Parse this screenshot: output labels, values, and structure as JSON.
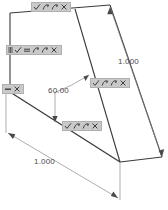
{
  "app": {
    "view_name": "parametric-sketch-viewport",
    "background_color": "#ffffff"
  },
  "sketch": {
    "line_color": "#3a3a3a",
    "dimension_color": "#4a4a4a",
    "geometry": {
      "description": "3D isometric wedge / inclined-plane sketch",
      "vertices": {
        "top_left": [
          10,
          13
        ],
        "top_mid": [
          78,
          8
        ],
        "top_right": [
          110,
          5
        ],
        "left_lower": [
          10,
          92
        ],
        "bottom_mid": [
          120,
          162
        ],
        "right_far": [
          162,
          157
        ]
      },
      "edges": [
        "top_left -> top_right (top back edge)",
        "top_left -> left_lower (left vertical edge)",
        "left_lower -> bottom_mid (lower front slope)",
        "top_mid -> bottom_mid (inclined face left rail)",
        "top_right -> right_far (inclined face right rail)",
        "bottom_mid -> right_far (bottom base edge)"
      ]
    }
  },
  "dimensions": [
    {
      "id": "dim-incline-length",
      "value": "1.000",
      "kind": "linear",
      "position": "right side, along inclined edge"
    },
    {
      "id": "dim-angle",
      "value": "60.00",
      "kind": "angular",
      "position": "center, between base and inclined face"
    },
    {
      "id": "dim-base-length",
      "value": "1.000",
      "kind": "linear",
      "position": "bottom left, along front slope"
    }
  ],
  "constraint_badges": [
    {
      "id": "badge-top-edge",
      "x": 31,
      "y": 2,
      "width": 40,
      "glyphs": [
        "check-icon",
        "curve-icon",
        "curve-icon",
        "close-icon"
      ]
    },
    {
      "id": "badge-left-edge",
      "x": 6,
      "y": 45,
      "width": 56,
      "glyphs": [
        "parallel-bars-icon",
        "check-icon",
        "equals-icon",
        "curve-icon",
        "curve-icon",
        "close-icon"
      ]
    },
    {
      "id": "badge-left-vertex",
      "x": 2,
      "y": 84,
      "width": 22,
      "glyphs": [
        "dash-icon",
        "close-icon"
      ]
    },
    {
      "id": "badge-incline-face",
      "x": 90,
      "y": 78,
      "width": 40,
      "glyphs": [
        "check-icon",
        "curve-icon",
        "curve-icon",
        "close-icon"
      ]
    },
    {
      "id": "badge-front-slope",
      "x": 62,
      "y": 121,
      "width": 40,
      "glyphs": [
        "check-icon",
        "curve-icon",
        "curve-icon",
        "close-icon"
      ]
    }
  ],
  "colors": {
    "badge_background": "#c9c9c9",
    "badge_border": "#b0b0b0",
    "glyph": "#3d3d3d",
    "geometry_line": "#3a3a3a",
    "dimension_line": "#8a8a8a"
  }
}
